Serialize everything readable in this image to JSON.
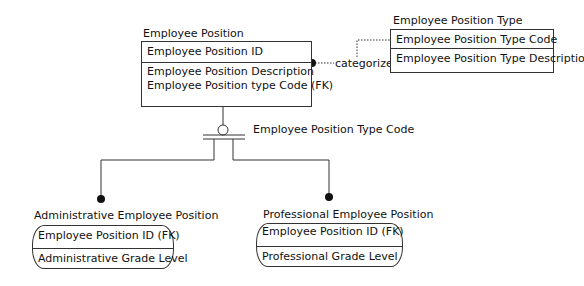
{
  "entities": {
    "employee_position": {
      "title": "Employee Position",
      "key": "Employee Position ID",
      "attributes": [
        "Employee Position Description",
        "Employee Position type Code (FK)"
      ]
    },
    "employee_position_type": {
      "title": "Employee Position Type",
      "key": "Employee Position Type Code",
      "attributes": [
        "Employee Position Type Description"
      ]
    },
    "administrative_employee_position": {
      "title": "Administrative Employee Position",
      "key": "Employee Position ID (FK)",
      "attributes": [
        "Administrative Grade Level"
      ]
    },
    "professional_employee_position": {
      "title": "Professional Employee Position",
      "key": "Employee Position ID (FK)",
      "attributes": [
        "Professional Grade Level"
      ]
    }
  },
  "relationships": {
    "categorizes": {
      "label": "categorizes",
      "style": "dotted"
    },
    "subtype_discriminator": {
      "label": "Employee Position Type Code"
    }
  },
  "colors": {
    "line": "#333333",
    "text": "#111111",
    "background": "#ffffff"
  }
}
